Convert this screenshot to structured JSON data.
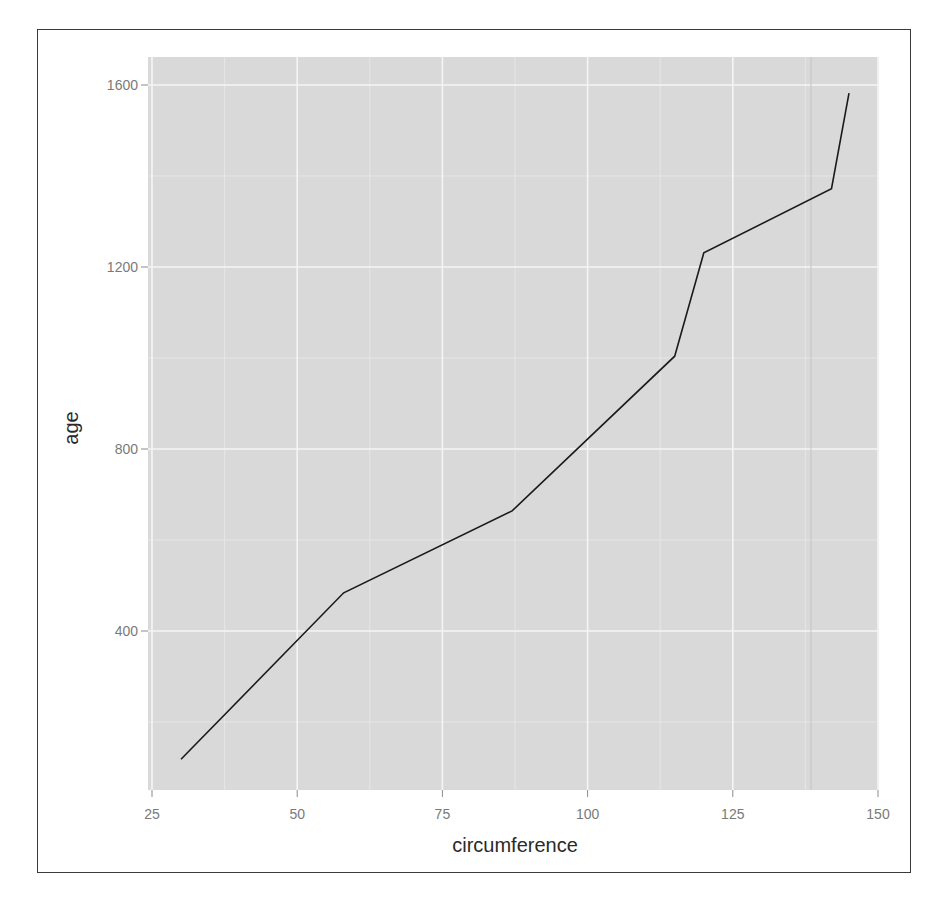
{
  "chart_data": {
    "type": "line",
    "title": "",
    "xlabel": "circumference",
    "ylabel": "age",
    "xlim": [
      25,
      150
    ],
    "ylim": [
      0,
      1600
    ],
    "x_ticks": [
      25,
      50,
      75,
      100,
      125,
      150
    ],
    "y_ticks": [
      400,
      800,
      1200,
      1600
    ],
    "x_tick_labels": [
      "25",
      "50",
      "75",
      "100",
      "125",
      "150"
    ],
    "y_tick_labels": [
      "400",
      "800",
      "1200",
      "1600"
    ],
    "grid": true,
    "legend": null,
    "series": [
      {
        "name": "age vs circumference",
        "color": "#1a1a1a",
        "x": [
          30,
          58,
          87,
          115,
          120,
          142,
          145
        ],
        "y": [
          118,
          484,
          664,
          1004,
          1231,
          1372,
          1582
        ]
      }
    ],
    "colors": {
      "panel_background": "#d9d9d9",
      "grid_major": "#f5f5f5",
      "grid_minor": "#e6e6e6",
      "tick_label": "#7a7a7a",
      "axis_title": "#2a2a2a",
      "frame": "#3a3a3a"
    }
  }
}
